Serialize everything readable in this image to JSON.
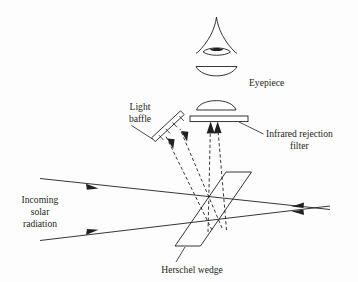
{
  "figure": {
    "background_color": "#fdfdfd",
    "ink_color": "#231f20",
    "width": 358,
    "height": 282
  },
  "labels": {
    "eyepiece": "Eyepiece",
    "light_baffle_line1": "Light",
    "light_baffle_line2": "baffle",
    "filter_line1": "Infrared rejection",
    "filter_line2": "filter",
    "incoming_line1": "Incoming",
    "incoming_line2": "solar",
    "incoming_line3": "radiation",
    "herschel_wedge": "Herschel wedge"
  },
  "components": [
    {
      "id": "eye",
      "name": "observer-eye",
      "description": "Eye symbol with pupil at top of optical path"
    },
    {
      "id": "eyepiece-lens",
      "name": "eyepiece-lens",
      "description": "Plano-convex eyepiece lens below the eye"
    },
    {
      "id": "field-lens",
      "name": "field-lens",
      "description": "Convex lens above the infrared rejection filter"
    },
    {
      "id": "ir-filter",
      "name": "infrared-rejection-filter",
      "description": "Thin horizontal filter plate"
    },
    {
      "id": "light-baffle",
      "name": "light-baffle",
      "description": "Angled vaned baffle at upper left"
    },
    {
      "id": "herschel-wedge",
      "name": "herschel-wedge",
      "description": "Slanted wedge prism in the solar beam"
    }
  ],
  "rays": {
    "incoming_count": 2,
    "reflected_dashed_to_baffle": 2,
    "reflected_dashed_to_filter": 2,
    "transmitted_outgoing": 2,
    "dash_pattern": "3.2 2.4"
  },
  "geometry": {
    "eye_apex": {
      "x": 216,
      "y": 18
    },
    "eye_center": {
      "x": 216,
      "y": 52
    },
    "eyepiece_lens_center": {
      "x": 216,
      "y": 72
    },
    "field_lens_center": {
      "x": 216,
      "y": 108
    },
    "filter_rect": {
      "x": 190,
      "y": 116,
      "width": 58,
      "height": 6
    },
    "baffle_center": {
      "x": 168,
      "y": 128
    },
    "wedge_top": {
      "x": 251,
      "y": 172
    },
    "wedge_bottom": {
      "x": 175,
      "y": 249
    }
  }
}
